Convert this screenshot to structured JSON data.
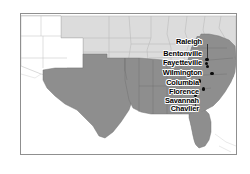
{
  "figure": {
    "kind": "regional-reference-map",
    "region_name": "Southeastern United States",
    "frame_border_color": "#8f8f8f",
    "background_color": "#ffffff"
  },
  "map": {
    "colors": {
      "highlighted_states_fill": "#8e8e8e",
      "other_states_fill": "#d9d9d9",
      "unshaded_states_fill": "#ffffff",
      "state_border_color": "#a8a8a8",
      "coastline_color": "#9a9a9a",
      "marker_color": "#0b0b0b",
      "label_color": "#000000",
      "label_halo_color": "#ffffff",
      "leader_line_color": "#3a3a3a"
    },
    "legend_note": "",
    "cities": [
      {
        "name": "Raleigh",
        "label_x": 148,
        "label_y": 37,
        "label_width": 53,
        "dot_x": 204.2,
        "dot_y": 57.0,
        "leader": {
          "x": 206,
          "y": 43,
          "height": 15
        }
      },
      {
        "name": "Bentonville",
        "label_x": 130,
        "label_y": 49,
        "label_width": 71,
        "dot_x": 203.6,
        "dot_y": 60.6,
        "leader": null
      },
      {
        "name": "Fayetteville",
        "label_x": 130,
        "label_y": 58,
        "label_width": 71,
        "dot_x": 205.0,
        "dot_y": 63.8,
        "leader": null
      },
      {
        "name": "Wilmington",
        "label_x": 134,
        "label_y": 68,
        "label_width": 67,
        "dot_x": 209.2,
        "dot_y": 71.0,
        "leader": null
      },
      {
        "name": "Columbia",
        "label_x": 144,
        "label_y": 78,
        "label_width": 54,
        "dot_x": 196.8,
        "dot_y": 78.4,
        "leader": null
      },
      {
        "name": "Florence",
        "label_x": 146,
        "label_y": 87,
        "label_width": 52,
        "dot_x": 200.6,
        "dot_y": 86.2,
        "leader": null
      },
      {
        "name": "Savannah",
        "label_x": 142,
        "label_y": 96,
        "label_width": 56,
        "dot_x": 193.0,
        "dot_y": 92.6,
        "leader": {
          "x": 194.4,
          "y": 95,
          "height": 12
        }
      },
      {
        "name": "Chavlier",
        "label_x": 151,
        "label_y": 104,
        "label_width": 47,
        "dot_x": 194.0,
        "dot_y": 108.0,
        "leader": null
      }
    ]
  }
}
